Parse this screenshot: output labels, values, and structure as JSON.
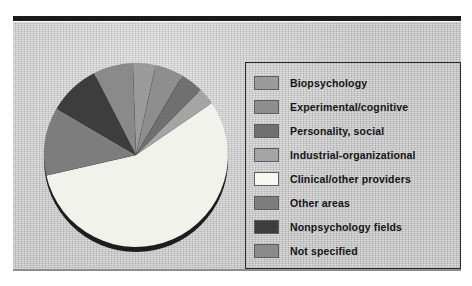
{
  "figure": {
    "background_color": "#c6c6c6",
    "rule_top_color": "#1a1a1a",
    "rule_bottom_color": "#8d8d8d",
    "legend_border_color": "#2b2b2b"
  },
  "chart_data": {
    "type": "pie",
    "title": "",
    "subtitle": "",
    "xlabel": "",
    "ylabel": "",
    "legend_position": "right",
    "grid": false,
    "start_angle_deg": 0,
    "direction": "clockwise",
    "categories": [
      "Biopsychology",
      "Experimental/cognitive",
      "Personality, social",
      "Industrial-organizational",
      "Clinical/other providers",
      "Other areas",
      "Nonpsychology fields",
      "Not specified"
    ],
    "values": [
      4,
      5,
      4,
      3,
      56,
      12,
      9,
      7
    ],
    "colors": [
      "#9b9b9b",
      "#8e8e8e",
      "#707070",
      "#a5a5a5",
      "#f2f2ec",
      "#7d7d7d",
      "#3d3d3d",
      "#8a8a8a"
    ],
    "slices": [
      {
        "label": "Biopsychology",
        "value": 4,
        "color": "#9b9b9b"
      },
      {
        "label": "Experimental/cognitive",
        "value": 5,
        "color": "#8e8e8e"
      },
      {
        "label": "Personality, social",
        "value": 4,
        "color": "#707070"
      },
      {
        "label": "Industrial-organizational",
        "value": 3,
        "color": "#a5a5a5"
      },
      {
        "label": "Clinical/other providers",
        "value": 56,
        "color": "#f2f2ec"
      },
      {
        "label": "Other areas",
        "value": 12,
        "color": "#7d7d7d"
      },
      {
        "label": "Nonpsychology fields",
        "value": 9,
        "color": "#3d3d3d"
      },
      {
        "label": "Not specified",
        "value": 7,
        "color": "#8a8a8a"
      }
    ]
  },
  "legend": {
    "items": [
      {
        "label": "Biopsychology",
        "color": "#9b9b9b"
      },
      {
        "label": "Experimental/cognitive",
        "color": "#8e8e8e"
      },
      {
        "label": "Personality, social",
        "color": "#707070"
      },
      {
        "label": "Industrial-organizational",
        "color": "#a5a5a5"
      },
      {
        "label": "Clinical/other providers",
        "color": "#f7f7f2"
      },
      {
        "label": "Other areas",
        "color": "#7d7d7d"
      },
      {
        "label": "Nonpsychology fields",
        "color": "#3d3d3d"
      },
      {
        "label": "Not specified",
        "color": "#8a8a8a"
      }
    ]
  }
}
